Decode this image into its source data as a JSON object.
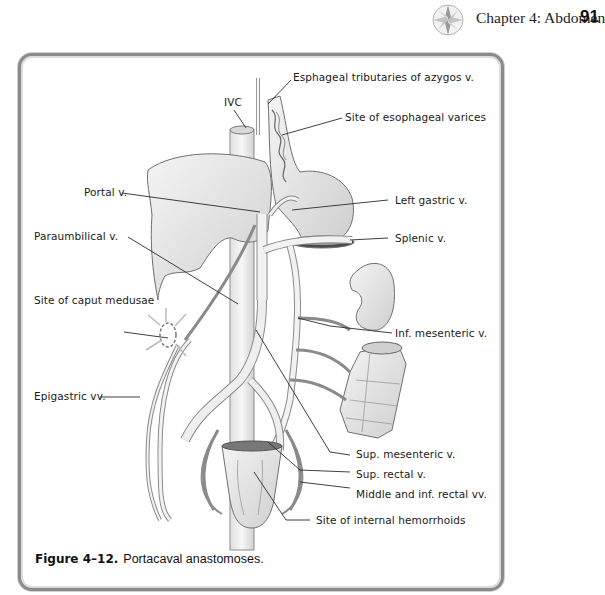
{
  "running_head": {
    "chapter": "Chapter 4: Abdomen",
    "page_number": "91",
    "icon": "compass-rose-icon"
  },
  "figure": {
    "number": "Figure 4–12.",
    "caption": "Portacaval anastomoses.",
    "labels": {
      "esophageal_tributaries": "Esphageal tributaries of azygos v.",
      "ivc": "IVC",
      "esophageal_varices": "Site of esophageal varices",
      "portal_v": "Portal v.",
      "left_gastric": "Left gastric v.",
      "paraumbilical": "Paraumbilical v.",
      "splenic": "Splenic v.",
      "caput_medusae": "Site of caput medusae",
      "inf_mesenteric": "Inf. mesenteric v.",
      "epigastric": "Epigastric vv.",
      "sup_mesenteric": "Sup. mesenteric v.",
      "sup_rectal": "Sup. rectal v.",
      "mid_inf_rectal": "Middle and inf. rectal vv.",
      "internal_hemorrhoids": "Site of internal hemorrhoids"
    }
  }
}
